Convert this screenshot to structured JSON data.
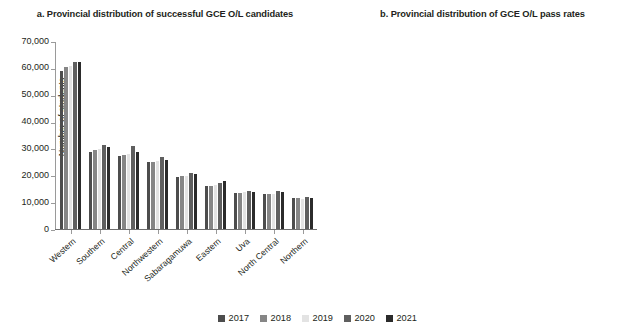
{
  "figure": {
    "legend": {
      "position": "bottom-center",
      "entries": [
        {
          "label": "2017",
          "color": "#4d4d4d"
        },
        {
          "label": "2018",
          "color": "#868686"
        },
        {
          "label": "2019",
          "color": "#e3e3e3"
        },
        {
          "label": "2020",
          "color": "#5f5f5f"
        },
        {
          "label": "2021",
          "color": "#2b2b2b"
        }
      ]
    }
  },
  "chart_data": [
    {
      "id": "panel-a",
      "type": "bar",
      "title": "a. Provincial distribution of successful GCE O/L candidates",
      "xlabel": "",
      "ylabel": "Number of students",
      "ylim": [
        0,
        70000
      ],
      "yticks": [
        0,
        10000,
        20000,
        30000,
        40000,
        50000,
        60000,
        70000
      ],
      "ytick_labels": [
        "0",
        "10,000",
        "20,000",
        "30,000",
        "40,000",
        "50,000",
        "60,000",
        "70,000"
      ],
      "grid": false,
      "categories": [
        "Western",
        "Southern",
        "Central",
        "Northwestern",
        "Sabaragamuwa",
        "Eastern",
        "Uva",
        "North Central",
        "Northern"
      ],
      "series": [
        {
          "name": "2017",
          "color": "#4d4d4d",
          "values": [
            58800,
            28800,
            27200,
            24800,
            19400,
            16000,
            13300,
            13000,
            11500
          ]
        },
        {
          "name": "2018",
          "color": "#868686",
          "values": [
            60300,
            29400,
            27600,
            25000,
            19600,
            16200,
            13400,
            13100,
            11400
          ]
        },
        {
          "name": "2019",
          "color": "#e3e3e3",
          "values": [
            60600,
            29700,
            28000,
            25200,
            19800,
            16400,
            13600,
            13200,
            11300
          ]
        },
        {
          "name": "2020",
          "color": "#5f5f5f",
          "values": [
            62200,
            31200,
            30900,
            26700,
            20800,
            17000,
            14300,
            14000,
            11800
          ]
        },
        {
          "name": "2021",
          "color": "#2b2b2b",
          "values": [
            62100,
            30400,
            28500,
            25800,
            20400,
            17900,
            13800,
            13900,
            11700
          ]
        }
      ]
    },
    {
      "id": "panel-b",
      "type": "bar",
      "title": "b. Provincial distribution of GCE O/L pass rates",
      "xlabel": "",
      "ylabel": "Percent",
      "ylim": [
        0,
        90
      ],
      "yticks": [
        0,
        10,
        20,
        30,
        40,
        50,
        60,
        70,
        80,
        90
      ],
      "ytick_labels": [
        "0",
        "10",
        "20",
        "30",
        "40",
        "50",
        "60",
        "70",
        "80",
        "90"
      ],
      "grid": false,
      "categories": [
        "Western",
        "Southern",
        "Central",
        "North Western",
        "Sabaragamuwa",
        "Eastern",
        "Uva",
        "North Central",
        "Northern"
      ],
      "series": [
        {
          "name": "2017",
          "color": "#4d4d4d",
          "values": [
            74.5,
            79.3,
            71.2,
            74.4,
            74.6,
            67.2,
            69.2,
            69.4,
            65.3
          ]
        },
        {
          "name": "2018",
          "color": "#868686",
          "values": [
            75.9,
            80.0,
            72.6,
            74.6,
            74.5,
            69.5,
            69.9,
            72.3,
            66.9
          ]
        },
        {
          "name": "2019",
          "color": "#e3e3e3",
          "values": [
            76.0,
            79.9,
            70.8,
            76.4,
            75.2,
            70.4,
            71.5,
            72.5,
            67.3
          ]
        },
        {
          "name": "2020",
          "color": "#5f5f5f",
          "values": [
            76.2,
            81.5,
            75.8,
            75.6,
            75.4,
            73.3,
            75.7,
            74.5,
            71.6
          ]
        },
        {
          "name": "2021",
          "color": "#2b2b2b",
          "values": [
            76.1,
            77.9,
            73.3,
            71.8,
            74.0,
            73.5,
            72.3,
            70.3,
            71.7
          ]
        }
      ]
    }
  ]
}
